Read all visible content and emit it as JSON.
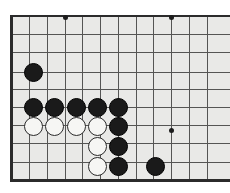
{
  "app": {
    "title": "Go Board Position",
    "board_background": "#e9e9e7",
    "line_color": "#555554",
    "edge_color": "#2b2b2b",
    "black_stone_color": "#1a1a1a",
    "white_stone_color": "#f6f6f4",
    "white_stone_outline": "#2a2a2a"
  },
  "board": {
    "origin_x": 11,
    "origin_y": 16,
    "cell_size": 17.7,
    "columns": 12,
    "rows": 10,
    "cropped_right": true,
    "column_x": [
      11,
      29,
      47,
      65,
      82,
      100,
      118,
      136,
      153,
      171,
      189,
      207
    ],
    "row_y": [
      16,
      34,
      52,
      72,
      89,
      107,
      125,
      143,
      162,
      180
    ],
    "edges": [
      {
        "name": "left-edge",
        "x": 10,
        "y": 15,
        "w": 3,
        "h": 167
      },
      {
        "name": "top-edge",
        "x": 10,
        "y": 15,
        "w": 220,
        "h": 2
      },
      {
        "name": "bottom-edge",
        "x": 10,
        "y": 179,
        "w": 220,
        "h": 3
      }
    ],
    "star_points": [
      {
        "name": "star-point-top-left",
        "x": 65,
        "y": 17
      },
      {
        "name": "star-point-top-right",
        "x": 171,
        "y": 17
      },
      {
        "name": "star-point-center-right",
        "x": 171,
        "y": 130
      }
    ],
    "stones": [
      {
        "name": "stone-black-upper-left",
        "color": "black",
        "x": 33,
        "y": 72
      },
      {
        "name": "stone-black-row-1",
        "color": "black",
        "x": 33,
        "y": 107
      },
      {
        "name": "stone-black-row-2",
        "color": "black",
        "x": 54,
        "y": 107
      },
      {
        "name": "stone-black-row-3",
        "color": "black",
        "x": 76,
        "y": 107
      },
      {
        "name": "stone-black-row-4",
        "color": "black",
        "x": 97,
        "y": 107
      },
      {
        "name": "stone-black-row-5",
        "color": "black",
        "x": 118,
        "y": 107
      },
      {
        "name": "stone-white-row-1",
        "color": "white",
        "x": 33,
        "y": 126
      },
      {
        "name": "stone-white-row-2",
        "color": "white",
        "x": 54,
        "y": 126
      },
      {
        "name": "stone-white-row-3",
        "color": "white",
        "x": 76,
        "y": 126
      },
      {
        "name": "stone-white-row-4",
        "color": "white",
        "x": 97,
        "y": 126
      },
      {
        "name": "stone-black-col-1",
        "color": "black",
        "x": 118,
        "y": 126
      },
      {
        "name": "stone-white-lower-1",
        "color": "white",
        "x": 97,
        "y": 146
      },
      {
        "name": "stone-black-col-2",
        "color": "black",
        "x": 118,
        "y": 146
      },
      {
        "name": "stone-white-lower-2",
        "color": "white",
        "x": 97,
        "y": 166
      },
      {
        "name": "stone-black-col-3",
        "color": "black",
        "x": 118,
        "y": 166
      },
      {
        "name": "stone-black-lower-right",
        "color": "black",
        "x": 155,
        "y": 166
      }
    ]
  }
}
